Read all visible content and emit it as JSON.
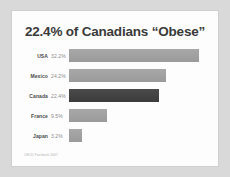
{
  "slide": {
    "title": "22.4% of Canadians “Obese”",
    "footnote": "OECD Factbook 2007"
  },
  "colors": {
    "background": "#d9d9d9",
    "panel": "#fdfdfd",
    "panel_border": "#cfcfcf",
    "title_text": "#3a3a3a",
    "label_text": "#4a4a4a",
    "value_text": "#8a8a8a",
    "bar_default_top": "#a8a8a8",
    "bar_default_bottom": "#9a9a9a",
    "bar_highlight_top": "#4a4a4a",
    "bar_highlight_bottom": "#3c3c3c",
    "footnote_text": "#b0b0b0"
  },
  "chart_data": {
    "type": "bar",
    "orientation": "horizontal",
    "title": "22.4% of Canadians “Obese”",
    "xlabel": "",
    "ylabel": "",
    "xlim": [
      0,
      35
    ],
    "grid": false,
    "legend": false,
    "highlight_category": "Canada",
    "categories": [
      "USA",
      "Mexico",
      "Canada",
      "France",
      "Japan"
    ],
    "values": [
      32.2,
      24.2,
      22.4,
      9.5,
      3.2
    ],
    "value_labels": [
      "32.2%",
      "24.2%",
      "22.4%",
      "9.5%",
      "3.2%"
    ],
    "bars": [
      {
        "label": "USA",
        "value": 32.2,
        "value_label": "32.2%",
        "highlight": false
      },
      {
        "label": "Mexico",
        "value": 24.2,
        "value_label": "24.2%",
        "highlight": false
      },
      {
        "label": "Canada",
        "value": 22.4,
        "value_label": "22.4%",
        "highlight": true
      },
      {
        "label": "France",
        "value": 9.5,
        "value_label": "9.5%",
        "highlight": false
      },
      {
        "label": "Japan",
        "value": 3.2,
        "value_label": "3.2%",
        "highlight": false
      }
    ],
    "annotations": [
      "OECD Factbook 2007"
    ]
  }
}
